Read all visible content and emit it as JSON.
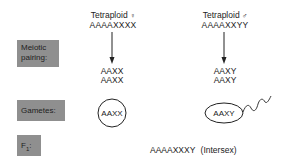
{
  "row_labels": {
    "meiotic_pairing": "Meiotic pairing:",
    "meiotic_pairing_line1": "Meiotic",
    "meiotic_pairing_line2": "pairing:",
    "gametes": "Gametes:",
    "f1": "F",
    "f1_sub": "1",
    "f1_colon": ":"
  },
  "female": {
    "title": "Tetraploid",
    "symbol": "♀",
    "genotype": "AAAAXXXX",
    "pairing_line1": "AAXX",
    "pairing_line2": "AAXX",
    "gamete": "AAXX",
    "gamete_shape": "circle (egg)"
  },
  "male": {
    "title": "Tetraploid",
    "symbol": "♂",
    "genotype": "AAAAXXYY",
    "pairing_line1": "AAXY",
    "pairing_line2": "AAXY",
    "gamete": "AAXY",
    "gamete_shape": "ellipse with wavy tail (sperm)"
  },
  "offspring": {
    "genotype": "AAAAXXXY",
    "note": "(Intersex)"
  },
  "colors": {
    "label_box": "#8f8f8f",
    "ink": "#222222",
    "background": "#ffffff"
  }
}
